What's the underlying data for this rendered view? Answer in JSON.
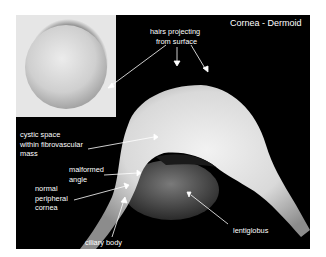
{
  "figure": {
    "title": "Cornea - Dermoid",
    "background_color": "#000000",
    "border_color": "#ffffff"
  },
  "labels": {
    "hairs": [
      "hairs projecting",
      "from surface"
    ],
    "cystic": [
      "cystic space",
      "within fibrovascular",
      "mass"
    ],
    "malformed": [
      "malformed",
      "angle"
    ],
    "normal": [
      "normal",
      "peripheral",
      "cornea"
    ],
    "ciliary": "ciliary body",
    "lentiglobus": "lentiglobus"
  }
}
